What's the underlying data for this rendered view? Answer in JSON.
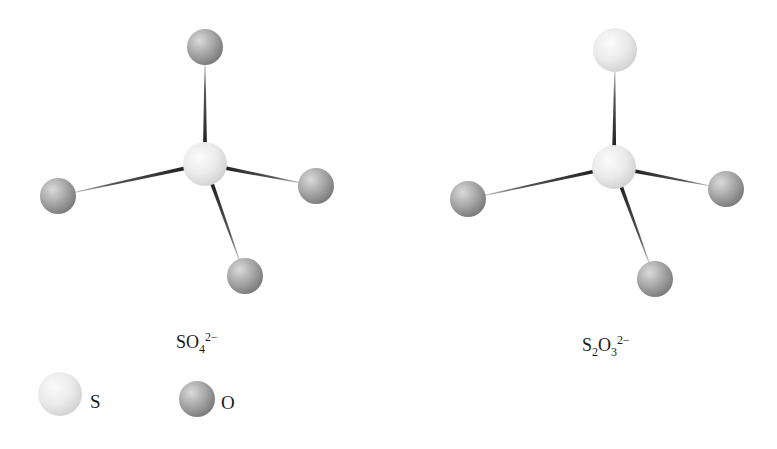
{
  "molecules": [
    {
      "id": "sulfate",
      "formula": {
        "parts": [
          {
            "text": "SO",
            "type": "normal"
          },
          {
            "text": "4",
            "type": "sub"
          },
          {
            "text": "2−",
            "type": "sup"
          }
        ],
        "plain": "SO4 2-"
      },
      "center_atom": {
        "element": "S",
        "x": 205,
        "y": 164,
        "r": 22
      },
      "atoms": [
        {
          "element": "O",
          "x": 205,
          "y": 47,
          "r": 18
        },
        {
          "element": "O",
          "x": 58,
          "y": 196,
          "r": 18
        },
        {
          "element": "O",
          "x": 316,
          "y": 186,
          "r": 18
        },
        {
          "element": "O",
          "x": 245,
          "y": 276,
          "r": 18
        }
      ]
    },
    {
      "id": "thiosulfate",
      "formula": {
        "parts": [
          {
            "text": "S",
            "type": "normal"
          },
          {
            "text": "2",
            "type": "sub"
          },
          {
            "text": "O",
            "type": "normal"
          },
          {
            "text": "3",
            "type": "sub"
          },
          {
            "text": "2−",
            "type": "sup"
          }
        ],
        "plain": "S2O3 2-"
      },
      "center_atom": {
        "element": "S",
        "x": 614,
        "y": 167,
        "r": 22
      },
      "atoms": [
        {
          "element": "S",
          "x": 615,
          "y": 50,
          "r": 22
        },
        {
          "element": "O",
          "x": 468,
          "y": 199,
          "r": 18
        },
        {
          "element": "O",
          "x": 726,
          "y": 189,
          "r": 18
        },
        {
          "element": "O",
          "x": 655,
          "y": 279,
          "r": 18
        }
      ]
    }
  ],
  "legend": {
    "items": [
      {
        "element": "S",
        "label": "S",
        "ball_x": 60,
        "ball_y": 394,
        "r": 22
      },
      {
        "element": "O",
        "label": "O",
        "ball_x": 197,
        "ball_y": 399,
        "r": 18
      }
    ]
  },
  "colors": {
    "sulfur_light": "#fafafa",
    "sulfur_mid": "#e9e9e9",
    "sulfur_dark": "#d2d2d2",
    "oxygen_light": "#d8d8d8",
    "oxygen_mid": "#a9a9a9",
    "oxygen_dark": "#7c7c7c",
    "bond_dark": "#222222",
    "bond_light": "#c8c8c8",
    "text": "#1a1a1a",
    "background": "#ffffff"
  }
}
